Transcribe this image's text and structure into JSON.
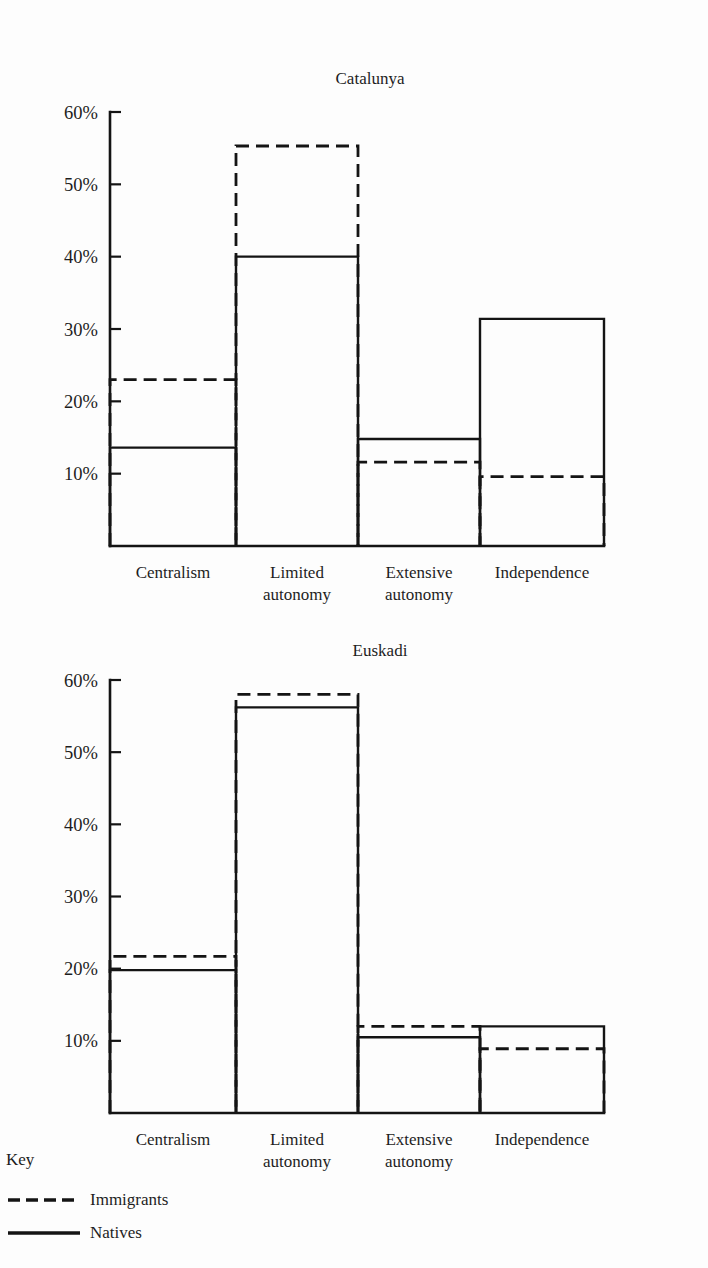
{
  "figure": {
    "background_color": "#fdfdfd",
    "ink_color": "#141414"
  },
  "key": {
    "heading": "Key",
    "entries": [
      {
        "style": "dashed",
        "label": "Immigrants"
      },
      {
        "style": "solid",
        "label": "Natives"
      }
    ]
  },
  "chart_data": [
    {
      "type": "bar",
      "title": "Catalunya",
      "xlabel": "",
      "ylabel": "",
      "ylim": [
        0,
        60
      ],
      "grid": false,
      "legend_position": "below-figure",
      "yticks": [
        10,
        20,
        30,
        40,
        50,
        60
      ],
      "ytick_labels": [
        "10%",
        "20%",
        "30%",
        "40%",
        "50%",
        "60%"
      ],
      "categories": [
        "Centralism",
        "Limited autonomy",
        "Extensive autonomy",
        "Independence"
      ],
      "series": [
        {
          "name": "Immigrants",
          "style": "dashed",
          "values": [
            23.0,
            55.3,
            11.6,
            9.6
          ]
        },
        {
          "name": "Natives",
          "style": "solid",
          "values": [
            13.6,
            40.0,
            14.8,
            31.4
          ]
        }
      ]
    },
    {
      "type": "bar",
      "title": "Euskadi",
      "xlabel": "",
      "ylabel": "",
      "ylim": [
        0,
        60
      ],
      "grid": false,
      "legend_position": "below-figure",
      "yticks": [
        10,
        20,
        30,
        40,
        50,
        60
      ],
      "ytick_labels": [
        "10%",
        "20%",
        "30%",
        "40%",
        "50%",
        "60%"
      ],
      "categories": [
        "Centralism",
        "Limited autonomy",
        "Extensive autonomy",
        "Independence"
      ],
      "series": [
        {
          "name": "Immigrants",
          "style": "dashed",
          "values": [
            21.7,
            58.0,
            12.0,
            8.9
          ]
        },
        {
          "name": "Natives",
          "style": "solid",
          "values": [
            19.8,
            56.2,
            10.5,
            12.0
          ]
        }
      ]
    }
  ],
  "category_label_lines": [
    [
      "Centralism"
    ],
    [
      "Limited",
      "autonomy"
    ],
    [
      "Extensive",
      "autonomy"
    ],
    [
      "Independence"
    ]
  ],
  "geometry": {
    "panels": [
      {
        "title_x": 370,
        "title_y": 84,
        "plot_left": 110,
        "plot_right": 604,
        "baseline_y": 546,
        "top_y": 112,
        "axis_top_y": 112
      },
      {
        "title_x": 380,
        "title_y": 656,
        "plot_left": 110,
        "plot_right": 604,
        "baseline_y": 1113,
        "top_y": 680,
        "axis_top_y": 680
      }
    ],
    "bar_edges": [
      110,
      236,
      358,
      480,
      604
    ],
    "category_label_y": [
      578,
      600
    ],
    "key": {
      "heading_x": 6,
      "heading_y": 1165,
      "line_x1": 8,
      "line_x2": 80,
      "label_x": 90,
      "rows_y": [
        1205,
        1238
      ]
    }
  }
}
